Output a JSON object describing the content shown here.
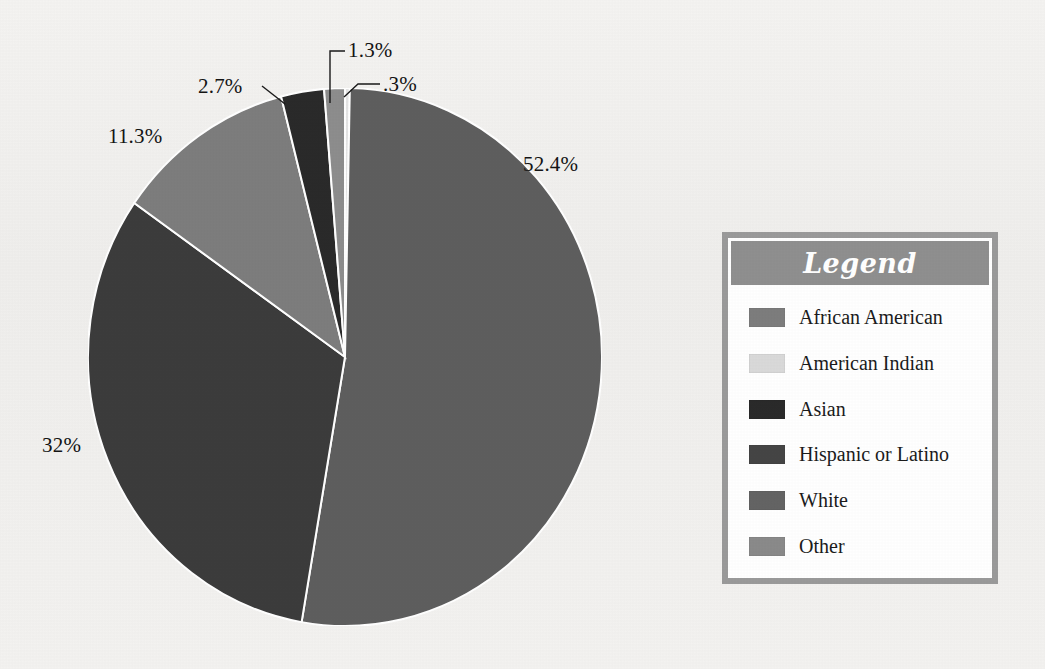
{
  "chart_data": {
    "type": "pie",
    "title": "",
    "subtitle": "",
    "xlabel": "",
    "ylabel": "",
    "legend_position": "right",
    "grid": false,
    "categories": [
      "African American",
      "American Indian",
      "Asian",
      "Hispanic or Latino",
      "White",
      "Other"
    ],
    "values": [
      11.3,
      0.3,
      2.7,
      32.0,
      52.4,
      1.3
    ],
    "value_unit": "percent",
    "data_labels": [
      "11.3%",
      ".3%",
      "2.7%",
      "32%",
      "52.4%",
      "1.3%"
    ],
    "colors": [
      "#7d7d7d",
      "#e4e4e4",
      "#2a2a2a",
      "#3c3c3c",
      "#5e5e5e",
      "#8d8d8d"
    ],
    "slices": [
      {
        "label": "American Indian",
        "value": 0.3,
        "data_label": ".3%",
        "color": "#e4e4e4"
      },
      {
        "label": "White",
        "value": 52.4,
        "data_label": "52.4%",
        "color": "#5e5e5e"
      },
      {
        "label": "Hispanic or Latino",
        "value": 32.0,
        "data_label": "32%",
        "color": "#3c3c3c"
      },
      {
        "label": "African American",
        "value": 11.3,
        "data_label": "11.3%",
        "color": "#7d7d7d"
      },
      {
        "label": "Asian",
        "value": 2.7,
        "data_label": "2.7%",
        "color": "#2a2a2a"
      },
      {
        "label": "Other",
        "value": 1.3,
        "data_label": "1.3%",
        "color": "#8d8d8d"
      }
    ]
  },
  "labels": {
    "white_pct": "52.4%",
    "hispanic_pct": "32%",
    "african_american_pct": "11.3%",
    "asian_pct": "2.7%",
    "other_pct": "1.3%",
    "american_indian_pct": ".3%"
  },
  "legend": {
    "title": "Legend",
    "title_bar_color": "#8f8f8f",
    "border_color": "#9a9a9a",
    "background_color": "#ffffff",
    "items": [
      {
        "label": "African American",
        "color": "#7d7d7d"
      },
      {
        "label": "American Indian",
        "color": "#d9d9d9"
      },
      {
        "label": "Asian",
        "color": "#2a2a2a"
      },
      {
        "label": "Hispanic or Latino",
        "color": "#454545"
      },
      {
        "label": "White",
        "color": "#646464"
      },
      {
        "label": "Other",
        "color": "#8a8a8a"
      }
    ]
  },
  "theme": {
    "page_background": "#f2f1ef",
    "text_color": "#141414",
    "slice_divider_color": "#ffffff"
  }
}
